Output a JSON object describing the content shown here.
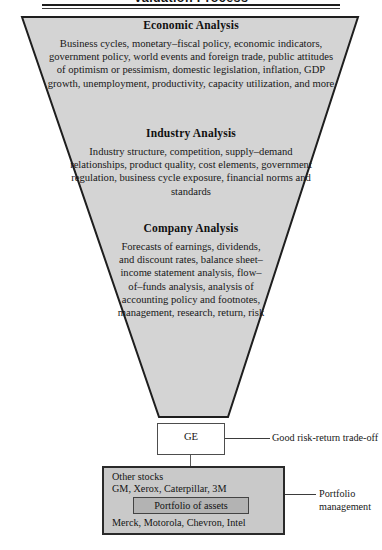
{
  "header": {
    "title": "Valuation Process"
  },
  "funnel": {
    "fill_color": "#d4d4d4",
    "stroke_color": "#1e1e1e",
    "sections": [
      {
        "id": "economic",
        "heading": "Economic Analysis",
        "body": "Business cycles, monetary–fiscal policy, economic indicators, government policy, world events and foreign trade, public attitudes of optimism or pessimism, domestic legislation, inflation, GDP growth, unemployment, productivity, capacity utilization, and more"
      },
      {
        "id": "industry",
        "heading": "Industry Analysis",
        "body": "Industry structure, competition, supply–demand relationships, product quality, cost elements, government regulation, business cycle exposure, financial norms and standards"
      },
      {
        "id": "company",
        "heading": "Company Analysis",
        "body": "Forecasts of earnings, dividends, and discount rates, balance sheet–income statement analysis, flow–of–funds analysis, analysis of accounting policy and footnotes, management, research, return, risk"
      }
    ]
  },
  "ge": {
    "label": "GE",
    "annotation": "Good risk-return trade-off"
  },
  "portfolio": {
    "line_1": "Other stocks",
    "line_2": "GM, Xerox, Caterpillar, 3M",
    "inner_label": "Portfolio of assets",
    "line_3": "Merck, Motorola, Chevron, Intel",
    "annotation": "Portfolio management",
    "box_color": "#c9c9c9",
    "inner_box_color": "#b3b3b3"
  }
}
